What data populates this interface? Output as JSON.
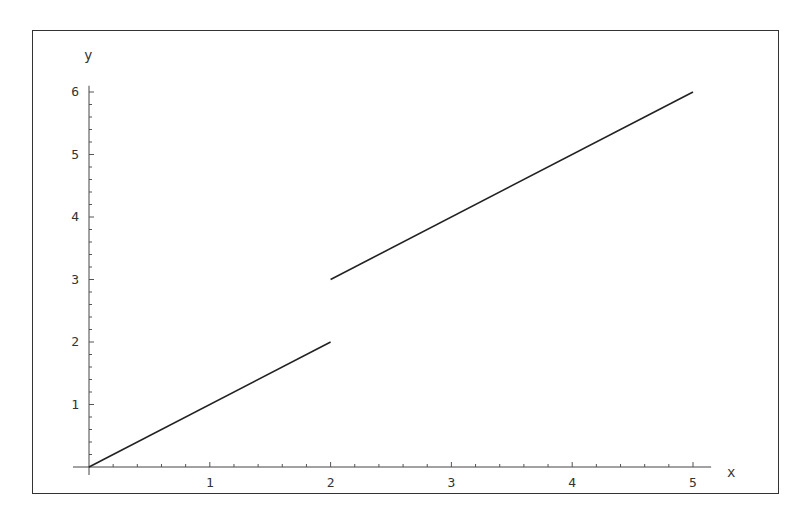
{
  "chart_data": {
    "type": "line",
    "title": "",
    "xlabel": "x",
    "ylabel": "y",
    "xlim": [
      0,
      5.15
    ],
    "ylim": [
      0,
      6.1
    ],
    "x_ticks": [
      1,
      2,
      3,
      4,
      5
    ],
    "y_ticks": [
      1,
      2,
      3,
      4,
      5,
      6
    ],
    "x_tick_labels": [
      "1",
      "2",
      "3",
      "4",
      "5"
    ],
    "y_tick_labels": [
      "1",
      "2",
      "3",
      "4",
      "5",
      "6"
    ],
    "minor_tick_step": 0.2,
    "grid": false,
    "legend": null,
    "series": [
      {
        "name": "piece-1 (y = x, 0 ≤ x ≤ 2)",
        "x": [
          0,
          2
        ],
        "y": [
          0,
          2
        ]
      },
      {
        "name": "piece-2 (y = x + 1, 2 ≤ x ≤ 5)",
        "x": [
          2,
          5
        ],
        "y": [
          3,
          6
        ]
      }
    ],
    "line_color": "#222222"
  }
}
